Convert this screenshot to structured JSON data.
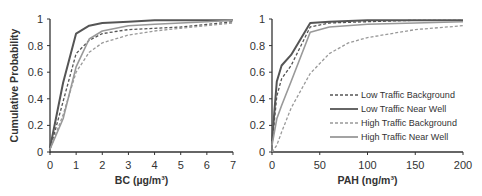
{
  "chart_data": [
    {
      "type": "line",
      "title": "",
      "xlabel": "BC (µg/m³)",
      "ylabel": "Cumulative Probability",
      "xlim": [
        0,
        7
      ],
      "ylim": [
        0,
        1
      ],
      "xticks": [
        "0",
        "1",
        "2",
        "3",
        "4",
        "5",
        "6",
        "7"
      ],
      "yticks": [
        "0",
        "0.2",
        "0.4",
        "0.6",
        "0.8",
        "1"
      ],
      "grid": false,
      "legend": false,
      "series": [
        {
          "name": "Low Traffic Background",
          "style": "dashed",
          "color": "#555555",
          "x": [
            0,
            0.5,
            1,
            1.5,
            2,
            3,
            4,
            5,
            6,
            7
          ],
          "y": [
            0.02,
            0.38,
            0.74,
            0.84,
            0.89,
            0.92,
            0.93,
            0.94,
            0.96,
            0.98
          ]
        },
        {
          "name": "Low Traffic Near Well",
          "style": "solid",
          "color": "#555555",
          "x": [
            0,
            0.5,
            1,
            1.5,
            2,
            3,
            4,
            5,
            6,
            7
          ],
          "y": [
            0.03,
            0.52,
            0.89,
            0.95,
            0.97,
            0.98,
            0.99,
            0.99,
            0.99,
            0.99
          ]
        },
        {
          "name": "High Traffic Background",
          "style": "dashed",
          "color": "#999999",
          "x": [
            0,
            0.5,
            1,
            1.5,
            2,
            3,
            4,
            5,
            6,
            7
          ],
          "y": [
            0.02,
            0.28,
            0.6,
            0.75,
            0.82,
            0.88,
            0.91,
            0.93,
            0.95,
            0.97
          ]
        },
        {
          "name": "High Traffic Near Well",
          "style": "solid",
          "color": "#999999",
          "x": [
            0,
            0.5,
            1,
            1.5,
            2,
            3,
            4,
            5,
            6,
            7
          ],
          "y": [
            0.02,
            0.25,
            0.64,
            0.85,
            0.91,
            0.95,
            0.96,
            0.97,
            0.98,
            0.99
          ]
        }
      ]
    },
    {
      "type": "line",
      "title": "",
      "xlabel": "PAH (ng/m³)",
      "ylabel": "",
      "xlim": [
        0,
        200
      ],
      "ylim": [
        0,
        1
      ],
      "xticks": [
        "0",
        "50",
        "100",
        "150",
        "200"
      ],
      "yticks": [
        "0",
        "0.2",
        "0.4",
        "0.6",
        "0.8",
        "1"
      ],
      "grid": false,
      "legend": true,
      "legend_position": "lower right",
      "series": [
        {
          "name": "Low Traffic Background",
          "style": "dashed",
          "color": "#555555",
          "x": [
            0,
            5,
            10,
            20,
            40,
            60,
            100,
            150,
            200
          ],
          "y": [
            0.05,
            0.42,
            0.55,
            0.65,
            0.94,
            0.97,
            0.98,
            0.99,
            0.99
          ]
        },
        {
          "name": "Low Traffic Near Well",
          "style": "solid",
          "color": "#555555",
          "x": [
            0,
            5,
            10,
            20,
            40,
            60,
            100,
            150,
            200
          ],
          "y": [
            0.08,
            0.53,
            0.65,
            0.73,
            0.97,
            0.98,
            0.99,
            0.99,
            0.99
          ]
        },
        {
          "name": "High Traffic Background",
          "style": "dashed",
          "color": "#999999",
          "x": [
            0,
            5,
            10,
            20,
            40,
            60,
            80,
            100,
            150,
            200
          ],
          "y": [
            0.0,
            0.05,
            0.15,
            0.33,
            0.59,
            0.74,
            0.82,
            0.86,
            0.92,
            0.95
          ]
        },
        {
          "name": "High Traffic Near Well",
          "style": "solid",
          "color": "#999999",
          "x": [
            0,
            5,
            10,
            20,
            40,
            60,
            100,
            150,
            200
          ],
          "y": [
            0.05,
            0.25,
            0.35,
            0.53,
            0.9,
            0.94,
            0.96,
            0.97,
            0.98
          ]
        }
      ]
    }
  ],
  "legend": {
    "items": [
      {
        "label": "Low Traffic Background"
      },
      {
        "label": "Low Traffic Near Well"
      },
      {
        "label": "High Traffic Background"
      },
      {
        "label": "High Traffic Near Well"
      }
    ]
  }
}
